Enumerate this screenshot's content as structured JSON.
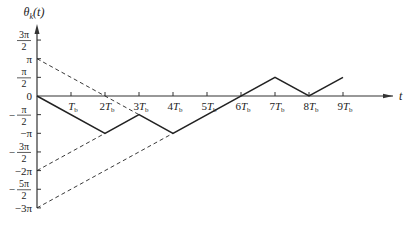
{
  "chart_data": {
    "type": "line",
    "title": "",
    "ylabel": "θ_k(t)",
    "xlabel": "t",
    "x_unit": "T_b",
    "xlim": [
      0,
      10.5
    ],
    "ylim": [
      -3,
      1.5
    ],
    "y_unit": "π",
    "x_ticks": [
      {
        "value": 1,
        "label": "T",
        "sub": "b",
        "coef": ""
      },
      {
        "value": 2,
        "label": "T",
        "sub": "b",
        "coef": "2"
      },
      {
        "value": 3,
        "label": "T",
        "sub": "b",
        "coef": "3"
      },
      {
        "value": 4,
        "label": "T",
        "sub": "b",
        "coef": "4"
      },
      {
        "value": 5,
        "label": "T",
        "sub": "b",
        "coef": "5"
      },
      {
        "value": 6,
        "label": "T",
        "sub": "b",
        "coef": "6"
      },
      {
        "value": 7,
        "label": "T",
        "sub": "b",
        "coef": "7"
      },
      {
        "value": 8,
        "label": "T",
        "sub": "b",
        "coef": "8"
      },
      {
        "value": 9,
        "label": "T",
        "sub": "b",
        "coef": "9"
      }
    ],
    "y_ticks": [
      {
        "value": 1.5,
        "num": "3π",
        "den": "2",
        "sign": ""
      },
      {
        "value": 1,
        "text": "π"
      },
      {
        "value": 0.5,
        "num": "π",
        "den": "2",
        "sign": ""
      },
      {
        "value": 0,
        "text": "0"
      },
      {
        "value": -0.5,
        "num": "π",
        "den": "2",
        "sign": "−"
      },
      {
        "value": -1,
        "text": "−π"
      },
      {
        "value": -1.5,
        "num": "3π",
        "den": "2",
        "sign": "−"
      },
      {
        "value": -2,
        "text": "−2π"
      },
      {
        "value": -2.5,
        "num": "5π",
        "den": "2",
        "sign": "−"
      },
      {
        "value": -3,
        "text": "−3π"
      }
    ],
    "series": [
      {
        "name": "phase trajectory",
        "style": "solid",
        "x": [
          0,
          2,
          3,
          4,
          7,
          8,
          9
        ],
        "y": [
          0,
          -1,
          -0.5,
          -1,
          0.5,
          0,
          0.5
        ]
      },
      {
        "name": "dashed ref 1",
        "style": "dashed",
        "x": [
          0,
          3
        ],
        "y": [
          1,
          -0.5
        ]
      },
      {
        "name": "dashed ref 2",
        "style": "dashed",
        "x": [
          0,
          2
        ],
        "y": [
          -2,
          -1
        ]
      },
      {
        "name": "dashed ref 3",
        "style": "dashed",
        "x": [
          0,
          4
        ],
        "y": [
          -3,
          -1
        ]
      }
    ]
  }
}
